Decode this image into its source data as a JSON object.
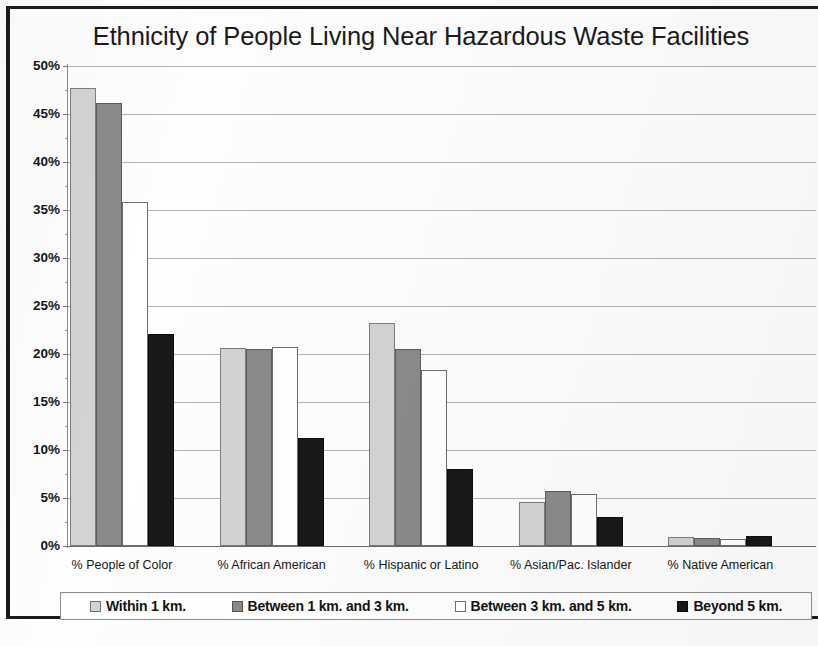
{
  "chart_data": {
    "type": "bar",
    "title": "Ethnicity of People Living Near Hazardous Waste Facilities",
    "xlabel": "",
    "ylabel": "",
    "ylim": [
      0,
      50
    ],
    "ytick_labels": [
      "50%",
      "45%",
      "40%",
      "35%",
      "30%",
      "25%",
      "20%",
      "15%",
      "10%",
      "5%",
      "0%"
    ],
    "ytick_values": [
      50,
      45,
      40,
      35,
      30,
      25,
      20,
      15,
      10,
      5,
      0
    ],
    "grid": true,
    "legend_position": "bottom",
    "categories": [
      "% People of Color",
      "% African American",
      "% Hispanic or Latino",
      "% Asian/Pac. Islander",
      "% Native American"
    ],
    "series": [
      {
        "name": "Within 1 km.",
        "color": "#d3d3d3",
        "values": [
          47.7,
          20.6,
          23.2,
          4.6,
          0.9
        ]
      },
      {
        "name": "Between 1 km. and 3 km.",
        "color": "#8a8a8a",
        "values": [
          46.1,
          20.5,
          20.5,
          5.7,
          0.8
        ]
      },
      {
        "name": "Between 3 km. and 5 km.",
        "color": "#ffffff",
        "values": [
          35.8,
          20.7,
          18.3,
          5.4,
          0.7
        ]
      },
      {
        "name": "Beyond 5 km.",
        "color": "#191919",
        "values": [
          22.1,
          11.3,
          8.0,
          3.0,
          1.0
        ]
      }
    ]
  },
  "legend": {
    "items": [
      {
        "label": "Within 1 km."
      },
      {
        "label": "Between 1 km. and 3 km."
      },
      {
        "label": "Between 3 km. and 5 km."
      },
      {
        "label": "Beyond 5 km."
      }
    ]
  }
}
